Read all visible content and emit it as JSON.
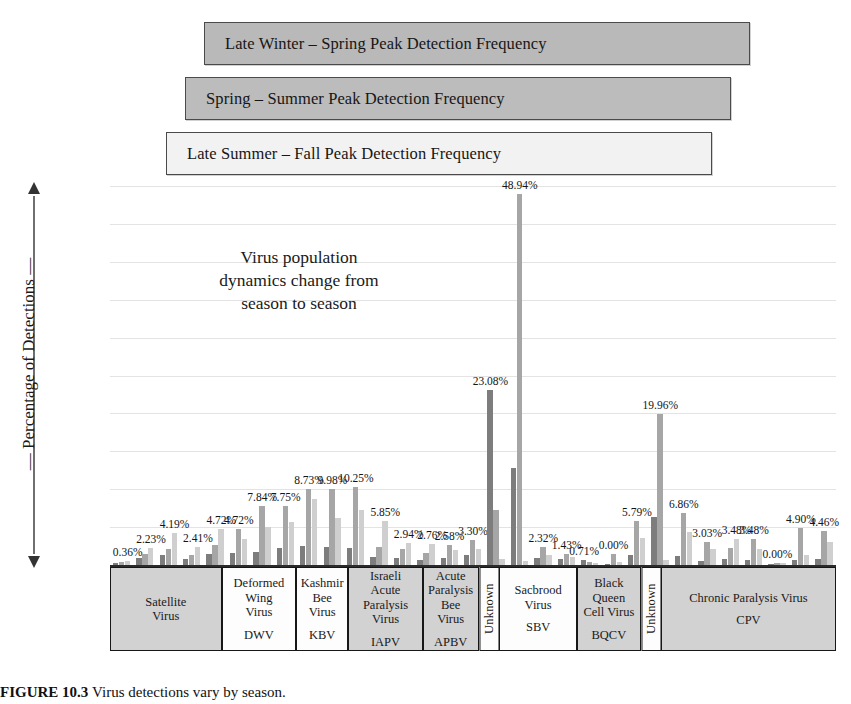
{
  "legend": {
    "items": [
      {
        "label": "Late Winter – Spring Peak Detection Frequency",
        "color": "#b9b9b9"
      },
      {
        "label": "Spring – Summer Peak Detection Frequency",
        "color": "#bcbcbc"
      },
      {
        "label": "Late Summer – Fall Peak Detection Frequency",
        "color": "#f2f2f2"
      }
    ]
  },
  "annotation": {
    "line1": "Virus population",
    "line2": "dynamics change from",
    "line3": "season to season"
  },
  "axis": {
    "y_title": "— Percentage of Detections —",
    "y_ticks": [
      "50%",
      "45%",
      "40%",
      "35%",
      "30%",
      "25%",
      "20%",
      "15%",
      "10%",
      "5%",
      "0%"
    ]
  },
  "caption": {
    "figure_number": "FIGURE 10.3",
    "text": "Virus detections vary by season."
  },
  "chart_data": {
    "type": "bar",
    "title": "",
    "xlabel": "",
    "ylabel": "Percentage of Detections",
    "ylim": [
      0,
      50
    ],
    "ytick_step": 5,
    "grid": true,
    "legend_position": "top",
    "series": [
      {
        "name": "Late Winter – Spring Peak Detection Frequency",
        "color": "#7d7d7d"
      },
      {
        "name": "Spring – Summer Peak Detection Frequency",
        "color": "#a6a6a6"
      },
      {
        "name": "Late Summer – Fall Peak Detection Frequency",
        "color": "#cfcfcf"
      }
    ],
    "categories": [
      {
        "name": "Satellite\nVirus",
        "abbrev": "",
        "shade": true,
        "span": 3,
        "vertical": false
      },
      {
        "name": "Deformed\nWing\nVirus",
        "abbrev": "DWV",
        "shade": false,
        "span": 2,
        "vertical": false
      },
      {
        "name": "Kashmir\nBee\nVirus",
        "abbrev": "KBV",
        "shade": false,
        "span": 1.4,
        "vertical": false
      },
      {
        "name": "Israeli\nAcute\nParalysis\nVirus",
        "abbrev": "IAPV",
        "shade": true,
        "span": 2,
        "vertical": false
      },
      {
        "name": "Acute\nParalysis\nBee\nVirus",
        "abbrev": "APBV",
        "shade": true,
        "span": 1.5,
        "vertical": false
      },
      {
        "name": "Unknown",
        "abbrev": "",
        "shade": false,
        "span": 0.55,
        "vertical": true
      },
      {
        "name": "Sacbrood\nVirus",
        "abbrev": "SBV",
        "shade": false,
        "span": 2.1,
        "vertical": false
      },
      {
        "name": "Black\nQueen\nCell Virus",
        "abbrev": "BQCV",
        "shade": true,
        "span": 1.7,
        "vertical": false
      },
      {
        "name": "Unknown",
        "abbrev": "",
        "shade": false,
        "span": 0.55,
        "vertical": true
      },
      {
        "name": "Chronic Paralysis Virus",
        "abbrev": "CPV",
        "shade": true,
        "span": 4.7,
        "vertical": false
      }
    ],
    "groups": [
      {
        "category": "Satellite Virus",
        "values": [
          0.2,
          0.36,
          0.55
        ],
        "label": "0.36%"
      },
      {
        "category": "Satellite Virus",
        "values": [
          0.95,
          1.45,
          2.23
        ],
        "label": "2.23%"
      },
      {
        "category": "Satellite Virus",
        "values": [
          1.3,
          2.1,
          4.19
        ],
        "label": "4.19%"
      },
      {
        "category": "Deformed Wing Virus",
        "values": [
          0.75,
          1.35,
          2.41
        ],
        "label": "2.41%"
      },
      {
        "category": "Deformed Wing Virus",
        "values": [
          1.45,
          2.6,
          4.72
        ],
        "label": "4.72%"
      },
      {
        "category": "Kashmir Bee Virus",
        "values": [
          1.55,
          4.72,
          3.4
        ],
        "label": "4.72%"
      },
      {
        "category": "Kashmir Bee Virus",
        "values": [
          1.7,
          7.84,
          5.05
        ],
        "label": "7.84%"
      },
      {
        "category": "Israeli Acute Paralysis Virus",
        "values": [
          2.2,
          7.75,
          5.65
        ],
        "label": "7.75%"
      },
      {
        "category": "Israeli Acute Paralysis Virus",
        "values": [
          2.45,
          9.98,
          8.73
        ],
        "label": "8.73%"
      },
      {
        "category": "Acute Paralysis Bee Virus",
        "values": [
          2.35,
          9.98,
          6.2
        ],
        "label": "9.98%"
      },
      {
        "category": "Acute Paralysis Bee Virus",
        "values": [
          2.3,
          10.25,
          7.3
        ],
        "label": "10.25%"
      },
      {
        "category": "Acute Paralysis Bee Virus",
        "values": [
          1.1,
          2.4,
          5.85
        ],
        "label": "5.85%"
      },
      {
        "category": "Unknown",
        "values": [
          0.95,
          2.1,
          2.94
        ],
        "label": "2.94%"
      },
      {
        "category": "Sacbrood Virus",
        "values": [
          0.7,
          1.55,
          2.76
        ],
        "label": "2.76%"
      },
      {
        "category": "Sacbrood Virus",
        "values": [
          0.95,
          2.58,
          1.95
        ],
        "label": "2.58%"
      },
      {
        "category": "Sacbrood Virus",
        "values": [
          1.3,
          3.3,
          2.1
        ],
        "label": "3.30%"
      },
      {
        "category": "Sacbrood Virus",
        "values": [
          23.08,
          7.2,
          0.8
        ],
        "label": "23.08%"
      },
      {
        "category": "Black Queen Cell Virus",
        "values": [
          12.8,
          48.94,
          0.5
        ],
        "label": "48.94%"
      },
      {
        "category": "Black Queen Cell Virus",
        "values": [
          0.95,
          2.32,
          1.3
        ],
        "label": "2.32%"
      },
      {
        "category": "Unknown",
        "values": [
          0.85,
          1.43,
          1.05
        ],
        "label": "1.43%"
      },
      {
        "category": "Unknown",
        "values": [
          0.71,
          0.4,
          0.25
        ],
        "label": "0.71%"
      },
      {
        "category": "Chronic Paralysis Virus",
        "values": [
          0.0,
          1.5,
          0.35
        ],
        "label": "0.00%"
      },
      {
        "category": "Chronic Paralysis Virus",
        "values": [
          1.35,
          5.79,
          3.55
        ],
        "label": "5.79%"
      },
      {
        "category": "Chronic Paralysis Virus",
        "values": [
          6.4,
          19.96,
          0.6
        ],
        "label": "19.96%"
      },
      {
        "category": "Chronic Paralysis Virus",
        "values": [
          1.15,
          6.86,
          4.4
        ],
        "label": "6.86%"
      },
      {
        "category": "Chronic Paralysis Virus",
        "values": [
          0.55,
          3.03,
          2.1
        ],
        "label": "3.03%"
      },
      {
        "category": "Chronic Paralysis Virus",
        "values": [
          0.85,
          2.3,
          3.48
        ],
        "label": "3.48%"
      },
      {
        "category": "Chronic Paralysis Virus",
        "values": [
          0.6,
          3.48,
          2.15
        ],
        "label": "3.48%"
      },
      {
        "category": "Chronic Paralysis Virus",
        "values": [
          0.0,
          0.3,
          0.25
        ],
        "label": "0.00%"
      },
      {
        "category": "Chronic Paralysis Virus",
        "values": [
          0.7,
          4.9,
          1.3
        ],
        "label": "4.90%"
      },
      {
        "category": "Chronic Paralysis Virus",
        "values": [
          0.75,
          4.46,
          3.0
        ],
        "label": "4.46%"
      }
    ]
  }
}
